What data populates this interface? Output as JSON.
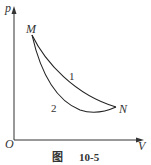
{
  "figure": {
    "caption_prefix": "图",
    "caption_number": "10-5",
    "axes": {
      "y_label": "p",
      "x_label": "V",
      "origin_label": "O"
    },
    "points": {
      "start": "M",
      "end": "N"
    },
    "curves": [
      {
        "id": "1",
        "label": "1",
        "description": "upper path from M to N"
      },
      {
        "id": "2",
        "label": "2",
        "description": "lower path from M to N"
      }
    ]
  }
}
